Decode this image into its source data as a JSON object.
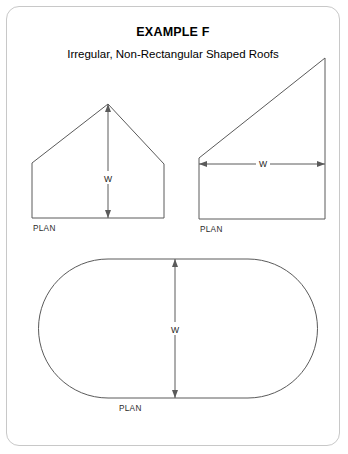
{
  "card": {
    "title": "EXAMPLE F",
    "subtitle": "Irregular, Non-Rectangular Shaped Roofs",
    "border_color": "#c8c8c8",
    "background_color": "#ffffff",
    "line_color": "#5a5a5a"
  },
  "figures": [
    {
      "id": "house-pentagon",
      "name": "Irregular gabled house plan",
      "dimension_label": "W",
      "dimension_orientation": "vertical",
      "plan_label": "PLAN"
    },
    {
      "id": "right-trapezoid",
      "name": "Non-rectangular trapezoid plan",
      "dimension_label": "W",
      "dimension_orientation": "horizontal",
      "plan_label": "PLAN"
    },
    {
      "id": "stadium-oval",
      "name": "Rounded stadium shaped plan",
      "dimension_label": "W",
      "dimension_orientation": "vertical",
      "plan_label": "PLAN"
    }
  ]
}
